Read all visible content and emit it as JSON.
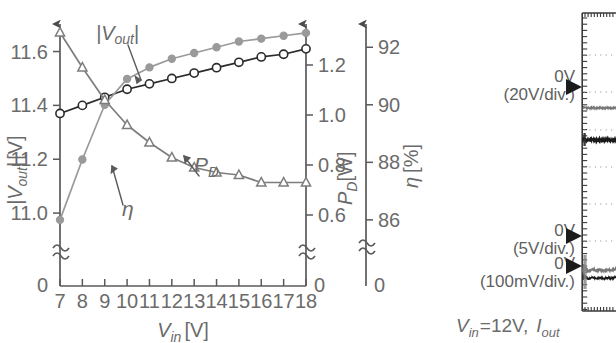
{
  "figure": {
    "left_panel": {
      "x_axis": {
        "label_main": "V",
        "label_sub": "in",
        "label_unit": "[V]",
        "ticks": [
          "7",
          "8",
          "9",
          "10",
          "11",
          "12",
          "13",
          "14",
          "15",
          "16",
          "17",
          "18"
        ],
        "min": 7,
        "max": 18
      },
      "y_axis_left": {
        "label_main": "|V",
        "label_sub": "out",
        "label_tail": "|",
        "label_unit": "[V]",
        "ticks": [
          "11.6",
          "11.4",
          "11.2",
          "11.0"
        ],
        "zero_label": "0",
        "min": 10.9,
        "max": 11.68,
        "break": true
      },
      "y_axis_right_1": {
        "label_main": "P",
        "label_sub": "D",
        "label_unit": "[W]",
        "ticks": [
          "1.2",
          "1.0",
          "0.8",
          "0.6"
        ],
        "zero_label": "0",
        "min": 0.5,
        "max": 1.34,
        "break": true
      },
      "y_axis_right_2": {
        "label_main": "η",
        "label_unit": "[%]",
        "ticks": [
          "92",
          "90",
          "88",
          "86"
        ],
        "zero_label": "0",
        "min": 85.3,
        "max": 92.6,
        "break": true
      },
      "annotations": [
        {
          "name": "vout-callout",
          "text_main": "|V",
          "text_sub": "out",
          "text_tail": "|"
        },
        {
          "name": "eta-callout",
          "text_main": "η"
        },
        {
          "name": "pd-callout",
          "text_main": "P",
          "text_sub": "D"
        }
      ]
    },
    "scope_panel": {
      "markers": [
        {
          "name": "marker-ch1",
          "zero": "0V",
          "scale": "(20V/div.)"
        },
        {
          "name": "marker-ch2",
          "zero": "0V",
          "scale": "(5V/div.)"
        },
        {
          "name": "marker-ch3",
          "zero": "0V",
          "scale": "(100mV/div.)"
        }
      ],
      "caption": {
        "v_main": "V",
        "v_sub": "in",
        "v_eq": "=12V,",
        "i_main": "I",
        "i_sub": "out"
      }
    },
    "colors": {
      "axis": "#5a5a5a",
      "vout_curve": "#2b2b2b",
      "eta_curve": "#9a9a9a",
      "pd_curve": "#7d7d7d",
      "text": "#6b6b6b",
      "scope_frame": "#3a3a3a",
      "scope_trace_dark": "#1a1a1a",
      "scope_trace_gray": "#777777"
    }
  },
  "chart_data": {
    "type": "line",
    "title": "",
    "xlabel": "V_in [V]",
    "ylabel": "|V_out| [V]",
    "xlim": [
      7,
      18
    ],
    "grid": false,
    "legend": "inline-annotations",
    "x": [
      7,
      8,
      9,
      10,
      11,
      12,
      13,
      14,
      15,
      16,
      17,
      18
    ],
    "series": [
      {
        "name": "|V_out|",
        "unit": "V",
        "axis": "left",
        "ylim": [
          10.9,
          11.68
        ],
        "marker": "open-circle",
        "color": "#2b2b2b",
        "values": [
          11.37,
          11.4,
          11.43,
          11.46,
          11.48,
          11.5,
          11.52,
          11.54,
          11.56,
          11.58,
          11.59,
          11.61
        ]
      },
      {
        "name": "η",
        "unit": "%",
        "axis": "right-2",
        "ylim": [
          85.3,
          92.6
        ],
        "marker": "filled-circle",
        "color": "#9a9a9a",
        "values": [
          86.0,
          88.1,
          90.0,
          90.9,
          91.3,
          91.6,
          91.8,
          92.0,
          92.2,
          92.3,
          92.4,
          92.5
        ]
      },
      {
        "name": "P_D",
        "unit": "W",
        "axis": "right-1",
        "ylim": [
          0.5,
          1.34
        ],
        "marker": "open-triangle",
        "color": "#7d7d7d",
        "values": [
          1.33,
          1.19,
          1.06,
          0.96,
          0.89,
          0.83,
          0.79,
          0.77,
          0.76,
          0.73,
          0.73,
          0.73
        ]
      }
    ]
  }
}
